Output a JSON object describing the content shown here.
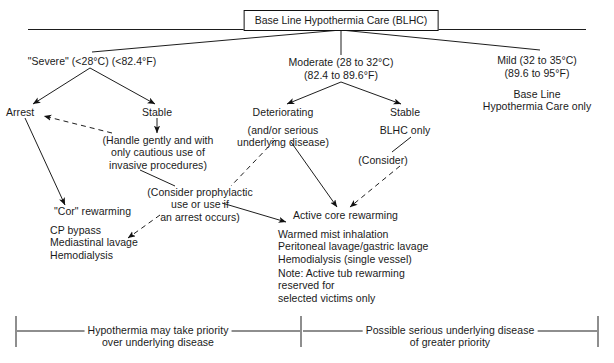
{
  "diagram": {
    "title": "Base Line Hypothermia Care (BLHC)",
    "root": {
      "label": "Base Line Hypothermia Care (BLHC)"
    },
    "branches": {
      "severe": {
        "label": "\"Severe\" (<28°C) (<82.4°F)",
        "arrest": "Arrest",
        "stable": "Stable",
        "handle_note": "(Handle gently and with\nonly cautious use of\ninvasive procedures)",
        "cor_title": "\"Cor\" rewarming",
        "cor_items": "CP bypass\nMediastinal lavage\nHemodialysis"
      },
      "moderate": {
        "label_line1": "Moderate (28 to 32°C)",
        "label_line2": "(82.4 to 89.6°F)",
        "deteriorating": "Deteriorating",
        "deteriorating_note": "(and/or serious\nunderlying disease)",
        "stable": "Stable",
        "stable_note": "BLHC only",
        "consider": "(Consider)",
        "prophylactic_note": "(Consider prophylactic\nuse or use if\nan arrest occurs)",
        "active_core_title": "Active core rewarming",
        "active_core_items": "Warmed mist inhalation\nPeritoneal lavage/gastric lavage\nHemodialysis (single vessel)",
        "active_core_note": "Note: Active tub rewarming\nreserved for\nselected victims only"
      },
      "mild": {
        "label_line1": "Mild (32 to 35°C)",
        "label_line2": "(89.6 to 95°F)",
        "care_note": "Base Line\nHypothermia Care only"
      }
    },
    "footer": {
      "left_bracket": "Hypothermia may take priority\nover underlying disease",
      "right_bracket": "Possible serious underlying disease\nof greater priority"
    },
    "colors": {
      "ink": "#111111",
      "background": "#ffffff"
    }
  }
}
